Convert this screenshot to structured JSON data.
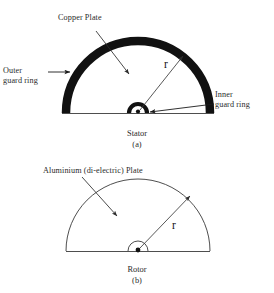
{
  "figure": {
    "background_color": "#ffffff",
    "ink_color": "#1a1a1a",
    "thick_ring_color": "#111111",
    "thin_line_color": "#3a3a3a"
  },
  "stator": {
    "caption_name": "Stator",
    "caption_index": "(a)",
    "labels": {
      "copper_plate": "Copper Plate",
      "outer_guard_ring_line1": "Outer",
      "outer_guard_ring_line2": "guard ring",
      "inner_guard_ring_line1": "Inner",
      "inner_guard_ring_line2": "guard ring",
      "radius_symbol": "r"
    }
  },
  "rotor": {
    "caption_name": "Rotor",
    "caption_index": "(b)",
    "labels": {
      "aluminium_plate": "Aluminium (di-electric) Plate",
      "radius_symbol": "r"
    }
  }
}
